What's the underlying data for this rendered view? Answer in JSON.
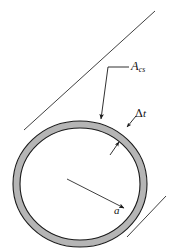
{
  "figure": {
    "name": "thin-walled-tube-cross-section",
    "background_color": "#ffffff",
    "wall_fill_color": "#b5b5b5",
    "outline_color": "#1a1a1a",
    "leader_color": "#2a2a2a"
  },
  "labels": {
    "area": {
      "base": "A",
      "subscript": "cs",
      "full": "A_cs",
      "meaning": "enclosed cross-sectional area"
    },
    "thickness": {
      "delta": "Δ",
      "base": "t",
      "full": "Δt",
      "meaning": "wall thickness"
    },
    "radius": {
      "base": "a",
      "full": "a",
      "meaning": "mean radius"
    }
  },
  "geometry": {
    "center": {
      "x": 80,
      "y": 184
    },
    "outer_radius": {
      "rx": 67,
      "ry": 63
    },
    "inner_radius": {
      "rx": 60,
      "ry": 56
    },
    "tangent_upper_left": {
      "x1": 155,
      "y1": 11,
      "x2": 24,
      "y2": 130
    },
    "tangent_lower_right": {
      "x1": 166,
      "y1": 196,
      "x2": 128,
      "y2": 236
    }
  }
}
